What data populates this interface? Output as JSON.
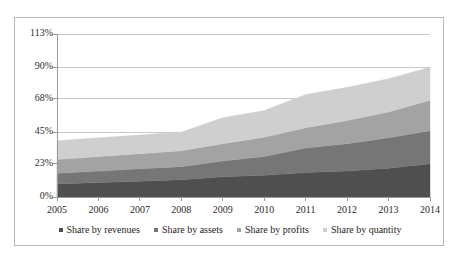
{
  "chart_data": {
    "type": "area",
    "stacked": true,
    "title": "",
    "xlabel": "",
    "ylabel": "",
    "categories": [
      "2005",
      "2006",
      "2007",
      "2008",
      "2009",
      "2010",
      "2011",
      "2012",
      "2013",
      "2014"
    ],
    "x": [
      2005,
      2006,
      2007,
      2008,
      2009,
      2010,
      2011,
      2012,
      2013,
      2014
    ],
    "ylim": [
      0,
      113
    ],
    "yticks": [
      0,
      23,
      45,
      68,
      90,
      113
    ],
    "ytick_labels": [
      "0%",
      "23%",
      "45%",
      "68%",
      "90%",
      "113%"
    ],
    "xtick_labels": [
      "2005",
      "2006",
      "2007",
      "2008",
      "2009",
      "2010",
      "2011",
      "2012",
      "2013",
      "2014"
    ],
    "grid": true,
    "grid_axis": "y",
    "legend_position": "bottom",
    "series": [
      {
        "name": "Share by revenues",
        "color": "#4f4f4f",
        "values": [
          9,
          10,
          11,
          12,
          14,
          15,
          17,
          18,
          20,
          23
        ]
      },
      {
        "name": "Share by assets",
        "color": "#767676",
        "values": [
          7.5,
          8,
          8.5,
          9,
          11,
          13,
          17,
          19,
          21,
          23
        ]
      },
      {
        "name": "Share by profits",
        "color": "#a3a3a3",
        "values": [
          9.5,
          10,
          10.5,
          11,
          12,
          13.5,
          14,
          16,
          18,
          21
        ]
      },
      {
        "name": "Share by quantity",
        "color": "#cfcfcf",
        "values": [
          13,
          13,
          13,
          13,
          18,
          18.5,
          23,
          23,
          23,
          23
        ]
      }
    ],
    "cumulative_tops": {
      "Share by revenues": [
        9,
        10,
        11,
        12,
        14,
        15,
        17,
        18,
        20,
        23
      ],
      "Share by assets": [
        16.5,
        18,
        19.5,
        21,
        25,
        28,
        34,
        37,
        41,
        46
      ],
      "Share by profits": [
        26,
        28,
        30,
        32,
        37,
        41.5,
        48,
        53,
        59,
        67
      ],
      "Share by quantity": [
        39,
        41,
        43,
        45,
        55,
        60,
        71,
        76,
        82,
        90
      ]
    }
  },
  "legend": {
    "items": [
      {
        "label": "Share by revenues",
        "color": "#4f4f4f"
      },
      {
        "label": "Share by assets",
        "color": "#767676"
      },
      {
        "label": "Share by profits",
        "color": "#a3a3a3"
      },
      {
        "label": "Share by quantity",
        "color": "#cfcfcf"
      }
    ]
  },
  "axes": {
    "y_labels": [
      "113%",
      "90%",
      "68%",
      "45%",
      "23%",
      "0%"
    ],
    "x_labels": [
      "2005",
      "2006",
      "2007",
      "2008",
      "2009",
      "2010",
      "2011",
      "2012",
      "2013",
      "2014"
    ]
  },
  "style": {
    "frame_color": "#b9b9b9",
    "grid_color": "#c8c8c8",
    "axis_color": "#9a9a9a",
    "text_color": "#2b2b2b"
  }
}
